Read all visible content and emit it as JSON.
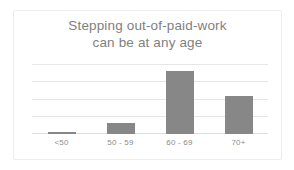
{
  "chart_data": {
    "type": "bar",
    "title": "Stepping out-of-paid-work\ncan be at any age",
    "title_line_1": "Stepping out-of-paid-work",
    "title_line_2": "can be at any age",
    "categories": [
      "<50",
      "50 - 59",
      "60 - 69",
      "70+"
    ],
    "values": [
      0.12,
      0.6,
      3.6,
      2.15
    ],
    "xlabel": "",
    "ylabel": "",
    "ylim": [
      0,
      4
    ],
    "gridlines": [
      0,
      1,
      2,
      3,
      4
    ],
    "grid": true,
    "y_tick_labels_visible": false,
    "legend": null,
    "legend_position": "none",
    "series": [
      {
        "name": "share",
        "values": [
          0.12,
          0.6,
          3.6,
          2.15
        ]
      }
    ],
    "colors": {
      "bar": "#878787",
      "gridline": "#e4e6e8",
      "baseline": "#dcdee0",
      "title_text": "#7f7f7f",
      "label_text": "#8c8c8c",
      "card_border": "#ededed",
      "background": "#ffffff"
    }
  }
}
